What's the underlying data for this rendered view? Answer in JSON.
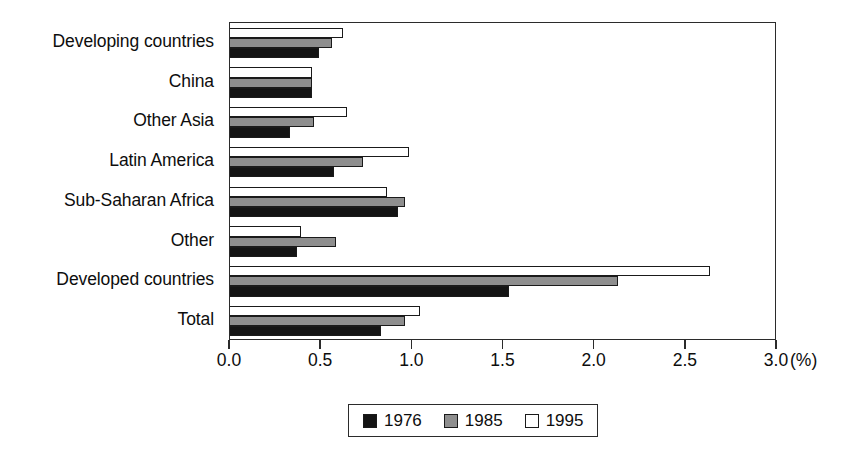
{
  "chart_data": {
    "type": "bar",
    "orientation": "horizontal",
    "title": "",
    "xlabel": "(%)",
    "ylabel": "",
    "xlim": [
      0.0,
      3.0
    ],
    "xticks": [
      "0.0",
      "0.5",
      "1.0",
      "1.5",
      "2.0",
      "2.5",
      "3.0"
    ],
    "xtick_values": [
      0.0,
      0.5,
      1.0,
      1.5,
      2.0,
      2.5,
      3.0
    ],
    "grid": false,
    "legend_position": "bottom-center",
    "categories": [
      "Developing countries",
      "China",
      "Other Asia",
      "Latin America",
      "Sub-Saharan Africa",
      "Other",
      "Developed countries",
      "Total"
    ],
    "series": [
      {
        "name": "1976",
        "color": "#141414",
        "values": [
          0.49,
          0.45,
          0.33,
          0.57,
          0.92,
          0.37,
          1.53,
          0.83
        ]
      },
      {
        "name": "1985",
        "color": "#8e8e8e",
        "values": [
          0.56,
          0.45,
          0.46,
          0.73,
          0.96,
          0.58,
          2.13,
          0.96
        ]
      },
      {
        "name": "1995",
        "color": "#ffffff",
        "values": [
          0.62,
          0.45,
          0.64,
          0.98,
          0.86,
          0.39,
          2.63,
          1.04
        ]
      }
    ]
  },
  "legend": {
    "items": [
      {
        "label": "1976",
        "swatch": "black-swatch"
      },
      {
        "label": "1985",
        "swatch": "gray-swatch"
      },
      {
        "label": "1995",
        "swatch": "white-swatch"
      }
    ]
  },
  "axis": {
    "unit_label": "(%)"
  },
  "colors": {
    "series_1976": "#141414",
    "series_1985": "#8e8e8e",
    "series_1995": "#ffffff",
    "axis_line": "#2b2b2b",
    "text": "#0d0d0d",
    "background": "#ffffff"
  }
}
